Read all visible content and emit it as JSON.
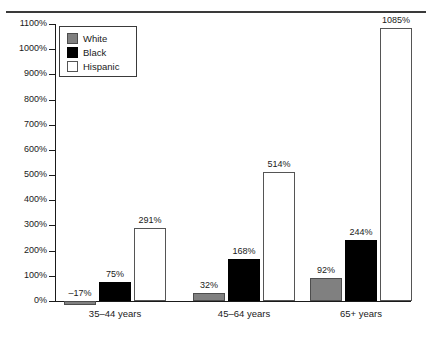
{
  "chart_data": {
    "type": "bar",
    "title": "",
    "subtitle": "",
    "xlabel": "",
    "ylabel": "",
    "categories": [
      "35–44 years",
      "45–64 years",
      "65+ years"
    ],
    "series": [
      {
        "name": "White",
        "color": "#808080",
        "values": [
          -17,
          32,
          92
        ],
        "value_labels": [
          "–17%",
          "32%",
          "92%"
        ]
      },
      {
        "name": "Black",
        "color": "#000000",
        "values": [
          75,
          168,
          244
        ],
        "value_labels": [
          "75%",
          "168%",
          "244%"
        ]
      },
      {
        "name": "Hispanic",
        "color": "#ffffff",
        "values": [
          291,
          514,
          1085
        ],
        "value_labels": [
          "291%",
          "514%",
          "1085%"
        ]
      }
    ],
    "ylim": [
      0,
      1100
    ],
    "ytick_step": 100,
    "ytick_labels": [
      "0%",
      "100%",
      "200%",
      "300%",
      "400%",
      "500%",
      "600%",
      "700%",
      "800%",
      "900%",
      "1000%",
      "1100%"
    ],
    "grid": false,
    "legend_position": "top-left",
    "legend_entries": [
      "White",
      "Black",
      "Hispanic"
    ]
  },
  "legend": {
    "items": [
      {
        "label": "White"
      },
      {
        "label": "Black"
      },
      {
        "label": "Hispanic"
      }
    ]
  },
  "axis": {
    "y_ticks": [
      {
        "label": "0%"
      },
      {
        "label": "100%"
      },
      {
        "label": "200%"
      },
      {
        "label": "300%"
      },
      {
        "label": "400%"
      },
      {
        "label": "500%"
      },
      {
        "label": "600%"
      },
      {
        "label": "700%"
      },
      {
        "label": "800%"
      },
      {
        "label": "900%"
      },
      {
        "label": "1000%"
      },
      {
        "label": "1100%"
      }
    ],
    "x_groups": [
      {
        "label": "35–44 years"
      },
      {
        "label": "45–64 years"
      },
      {
        "label": "65+ years"
      }
    ]
  },
  "bars": [
    {
      "group": 0,
      "series": "White",
      "label": "–17%"
    },
    {
      "group": 0,
      "series": "Black",
      "label": "75%"
    },
    {
      "group": 0,
      "series": "Hispanic",
      "label": "291%"
    },
    {
      "group": 1,
      "series": "White",
      "label": "32%"
    },
    {
      "group": 1,
      "series": "Black",
      "label": "168%"
    },
    {
      "group": 1,
      "series": "Hispanic",
      "label": "514%"
    },
    {
      "group": 2,
      "series": "White",
      "label": "92%"
    },
    {
      "group": 2,
      "series": "Black",
      "label": "244%"
    },
    {
      "group": 2,
      "series": "Hispanic",
      "label": "1085%"
    }
  ]
}
